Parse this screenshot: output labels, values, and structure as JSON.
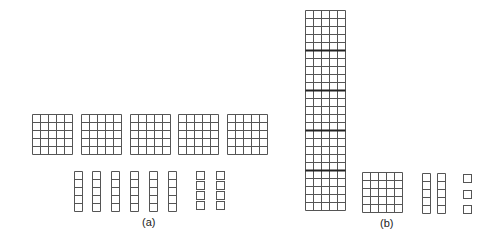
{
  "figure": {
    "panel_a": {
      "label": "(a)",
      "flats": {
        "count": 5,
        "grid": "5x5",
        "xs": [
          32,
          81,
          130,
          178,
          227
        ],
        "y": 114,
        "cell": 8
      },
      "rods": {
        "count": 6,
        "cells": 5,
        "xs": [
          74,
          92,
          111,
          130,
          149,
          168
        ],
        "y": 171,
        "cell": 8
      },
      "units": {
        "columns": 2,
        "per_column": 4,
        "xs": [
          196,
          216
        ],
        "ys": [
          171,
          181,
          191,
          201
        ],
        "size": 8
      }
    },
    "panel_b": {
      "label": "(b)",
      "tall_block": {
        "x": 305,
        "y": 10,
        "cols": 5,
        "rows": 25,
        "cell": 8,
        "thick_every": 5
      },
      "flats": {
        "count": 1,
        "grid": "5x5",
        "xs": [
          362
        ],
        "y": 172,
        "cell": 8
      },
      "rods": {
        "count": 2,
        "cells": 5,
        "xs": [
          422,
          437
        ],
        "y": 173,
        "cell": 8
      },
      "units": {
        "columns": 1,
        "per_column": 3,
        "xs": [
          463
        ],
        "ys": [
          174,
          190,
          205
        ],
        "size": 8
      }
    },
    "colors": {
      "line": "#555555",
      "thick_line": "#222222",
      "background": "#ffffff"
    }
  }
}
